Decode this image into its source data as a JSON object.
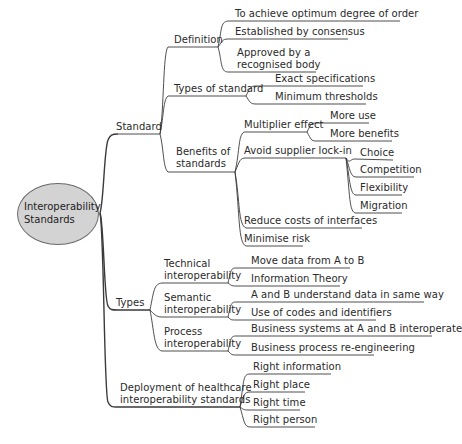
{
  "root": {
    "label_line1": "Interoperability",
    "label_line2": "Standards",
    "fill": "#d3d3d3"
  },
  "standard": {
    "label": "Standard",
    "definition": {
      "label": "Definition",
      "items": [
        "To achieve optimum degree of order",
        "Established by consensus",
        "Approved by a",
        "recognised body"
      ]
    },
    "types_of_standard": {
      "label": "Types of standard",
      "items": [
        "Exact specifications",
        "Minimum thresholds"
      ]
    },
    "benefits": {
      "label_line1": "Benefits of",
      "label_line2": "standards",
      "multiplier": {
        "label": "Multiplier effect",
        "items": [
          "More use",
          "More benefits"
        ]
      },
      "lockin": {
        "label": "Avoid supplier lock-in",
        "items": [
          "Choice",
          "Competition",
          "Flexibility",
          "Migration"
        ]
      },
      "items": [
        "Reduce costs of interfaces",
        "Minimise risk"
      ]
    }
  },
  "types": {
    "label": "Types",
    "technical": {
      "label_line1": "Technical",
      "label_line2": "interoperability",
      "items": [
        "Move data from A to B",
        "Information Theory"
      ]
    },
    "semantic": {
      "label_line1": "Semantic",
      "label_line2": "interoperability",
      "items": [
        "A and B understand data in same way",
        "Use of codes and identifiers"
      ]
    },
    "process": {
      "label_line1": "Process",
      "label_line2": "interoperability",
      "items": [
        "Business systems at A and B interoperate",
        "Business process re-engineering"
      ]
    }
  },
  "deployment": {
    "label_line1": "Deployment of healthcare",
    "label_line2": "interoperability standards",
    "items": [
      "Right information",
      "Right place",
      "Right time",
      "Right person"
    ]
  }
}
